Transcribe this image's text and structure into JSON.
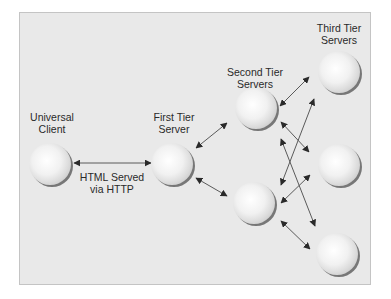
{
  "diagram": {
    "type": "multi-tier architecture",
    "colors": {
      "background": "#e9e9e9",
      "frame_border": "#c4c4c4",
      "sphere_highlight": "#ffffff",
      "sphere_base": "#d9d9d9",
      "sphere_shadow": "#6e6e6e",
      "arrow": "#555555",
      "text": "#2a2a2a"
    },
    "labels": {
      "client": {
        "line1": "Universal",
        "line2": "Client"
      },
      "first_tier": {
        "line1": "First Tier",
        "line2": "Server"
      },
      "second_tier": {
        "line1": "Second Tier",
        "line2": "Servers"
      },
      "third_tier": {
        "line1": "Third Tier",
        "line2": "Servers"
      },
      "connection": {
        "line1": "HTML Served",
        "line2": "via HTTP"
      }
    },
    "nodes": [
      {
        "id": "client",
        "tier": "Universal Client",
        "icon": "sphere-icon"
      },
      {
        "id": "first",
        "tier": "First Tier Server",
        "icon": "sphere-icon"
      },
      {
        "id": "second-top",
        "tier": "Second Tier Servers",
        "icon": "sphere-icon"
      },
      {
        "id": "second-bottom",
        "tier": "Second Tier Servers",
        "icon": "sphere-icon"
      },
      {
        "id": "third-top",
        "tier": "Third Tier Servers",
        "icon": "sphere-icon"
      },
      {
        "id": "third-middle",
        "tier": "Third Tier Servers",
        "icon": "sphere-icon"
      },
      {
        "id": "third-bottom",
        "tier": "Third Tier Servers",
        "icon": "sphere-icon"
      }
    ],
    "edges": [
      {
        "from": "client",
        "to": "first",
        "bidirectional": true,
        "label": "HTML Served via HTTP"
      },
      {
        "from": "first",
        "to": "second-top",
        "bidirectional": true
      },
      {
        "from": "first",
        "to": "second-bottom",
        "bidirectional": true
      },
      {
        "from": "second-top",
        "to": "third-top",
        "bidirectional": true
      },
      {
        "from": "second-top",
        "to": "third-middle",
        "bidirectional": true
      },
      {
        "from": "second-top",
        "to": "third-bottom",
        "bidirectional": true
      },
      {
        "from": "second-bottom",
        "to": "third-top",
        "bidirectional": true
      },
      {
        "from": "second-bottom",
        "to": "third-middle",
        "bidirectional": true
      },
      {
        "from": "second-bottom",
        "to": "third-bottom",
        "bidirectional": true
      }
    ]
  }
}
